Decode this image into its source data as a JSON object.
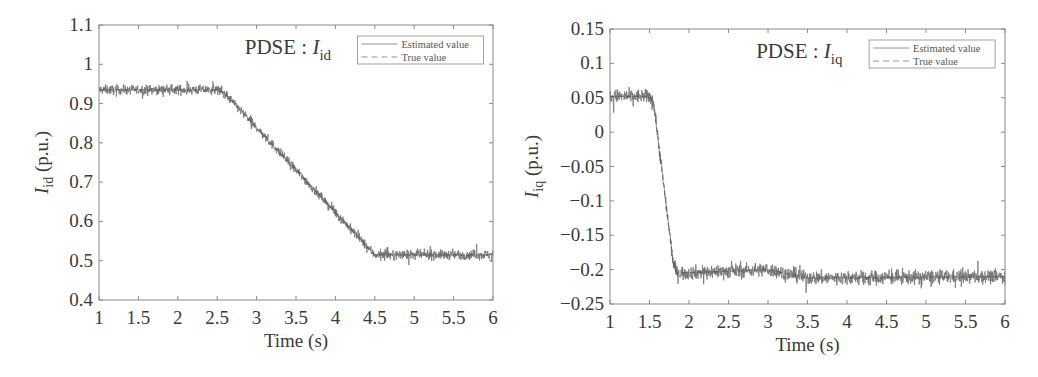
{
  "colors": {
    "estimated": "#6e6e6e",
    "true": "#4a4a4a",
    "axis": "#8a8a8a",
    "text": "#3a3a3a"
  },
  "chart_data": [
    {
      "type": "line",
      "title": "",
      "annotation": {
        "prefix": "PDSE : ",
        "symbol": "I",
        "subscript": "id"
      },
      "xlabel": "Time (s)",
      "ylabel": {
        "symbol": "I",
        "subscript": "id",
        "unit": " (p.u.)"
      },
      "xlim": [
        1,
        6
      ],
      "ylim": [
        0.4,
        1.1
      ],
      "xticks": [
        1,
        1.5,
        2,
        2.5,
        3,
        3.5,
        4,
        4.5,
        5,
        5.5,
        6
      ],
      "xtick_labels": [
        "1",
        "1.5",
        "2",
        "2.5",
        "3",
        "3.5",
        "4",
        "4.5",
        "5",
        "5.5",
        "6"
      ],
      "yticks": [
        0.4,
        0.5,
        0.6,
        0.7,
        0.8,
        0.9,
        1.0,
        1.1
      ],
      "ytick_labels": [
        "0.4",
        "0.5",
        "0.6",
        "0.7",
        "0.8",
        "0.9",
        "1",
        "1.1"
      ],
      "grid": false,
      "legend": {
        "position": "upper right",
        "entries": [
          "Estimated value",
          "True value"
        ]
      },
      "noise_amplitude": 0.012,
      "series": [
        {
          "name": "Estimated value",
          "style": "solid",
          "noisy": true,
          "x": [
            1,
            2.5,
            2.6,
            4.5,
            4.55,
            6
          ],
          "y": [
            0.935,
            0.935,
            0.925,
            0.515,
            0.515,
            0.515
          ]
        },
        {
          "name": "True value",
          "style": "dashed",
          "noisy": false,
          "x": [
            1,
            2.5,
            2.6,
            4.5,
            4.55,
            6
          ],
          "y": [
            0.935,
            0.935,
            0.925,
            0.515,
            0.515,
            0.515
          ]
        }
      ]
    },
    {
      "type": "line",
      "title": "",
      "annotation": {
        "prefix": "PDSE : ",
        "symbol": "I",
        "subscript": "iq"
      },
      "xlabel": "Time (s)",
      "ylabel": {
        "symbol": "I",
        "subscript": "iq",
        "unit": " (p.u.)"
      },
      "xlim": [
        1,
        6
      ],
      "ylim": [
        -0.25,
        0.15
      ],
      "xticks": [
        1,
        1.5,
        2,
        2.5,
        3,
        3.5,
        4,
        4.5,
        5,
        5.5,
        6
      ],
      "xtick_labels": [
        "1",
        "1.5",
        "2",
        "2.5",
        "3",
        "3.5",
        "4",
        "4.5",
        "5",
        "5.5",
        "6"
      ],
      "yticks": [
        -0.25,
        -0.2,
        -0.15,
        -0.1,
        -0.05,
        0,
        0.05,
        0.1,
        0.15
      ],
      "ytick_labels": [
        "−0.25",
        "−0.2",
        "−0.15",
        "−0.1",
        "−0.05",
        "0",
        "0.05",
        "0.1",
        "0.15"
      ],
      "grid": false,
      "legend": {
        "position": "upper right",
        "entries": [
          "Estimated value",
          "True value"
        ]
      },
      "noise_amplitude": 0.01,
      "series": [
        {
          "name": "Estimated value",
          "style": "solid",
          "noisy": true,
          "x": [
            1,
            1.5,
            1.55,
            1.8,
            1.85,
            3.0,
            3.5,
            4.0,
            6
          ],
          "y": [
            0.052,
            0.052,
            0.045,
            -0.19,
            -0.205,
            -0.2,
            -0.212,
            -0.212,
            -0.21
          ]
        },
        {
          "name": "True value",
          "style": "dashed",
          "noisy": false,
          "x": [
            1,
            1.5,
            1.55,
            1.8,
            1.85,
            3.0,
            3.5,
            4.0,
            6
          ],
          "y": [
            0.052,
            0.052,
            0.045,
            -0.19,
            -0.205,
            -0.2,
            -0.212,
            -0.212,
            -0.21
          ]
        }
      ]
    }
  ],
  "layout_boxes": [
    {
      "left": 99,
      "top": 25,
      "right": 493,
      "bottom": 300
    },
    {
      "left": 610,
      "top": 29,
      "right": 1005,
      "bottom": 304
    }
  ]
}
